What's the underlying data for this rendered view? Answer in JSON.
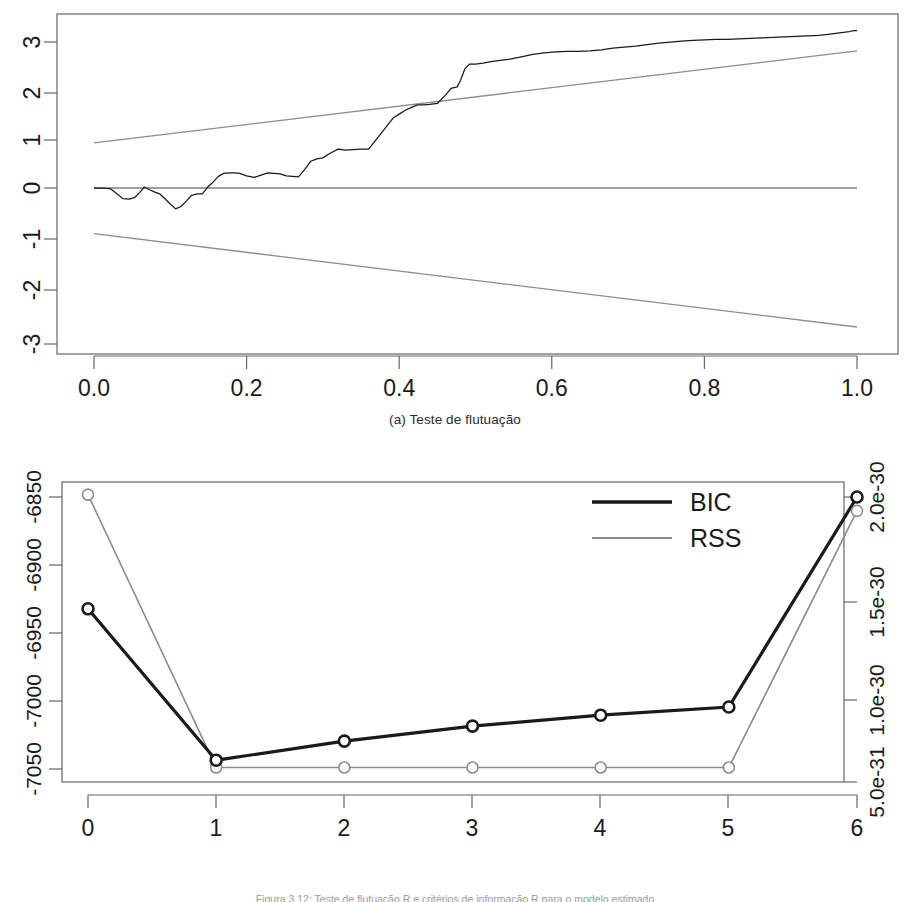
{
  "figure": {
    "caption_partial": "Figura 3.12: Teste de flutuação R e critérios de informação R para o modelo estimado"
  },
  "panels": [
    {
      "id": "a",
      "caption": "(a) Teste de flutuação"
    },
    {
      "id": "b",
      "caption": "(b) Critérios de informação"
    }
  ],
  "colors": {
    "series_black": "#1a1a1a",
    "series_gray": "#8c8c8c",
    "axis": "#555555",
    "frame": "#666666",
    "zero_line": "#808080"
  },
  "chart_data": [
    {
      "type": "line",
      "panel": "a",
      "title": "(a) Teste de flutuação",
      "xlabel": "",
      "ylabel": "",
      "xlim": [
        0.0,
        1.0
      ],
      "ylim": [
        -3.35,
        3.5
      ],
      "grid": false,
      "legend": "none",
      "xticks": [
        0.0,
        0.2,
        0.4,
        0.6,
        0.8,
        1.0
      ],
      "xticklabels": [
        "0.0",
        "0.2",
        "0.4",
        "0.6",
        "0.8",
        "1.0"
      ],
      "yticks": [
        -3,
        -2,
        -1,
        0,
        1,
        2,
        3
      ],
      "yticklabels": [
        "-3",
        "-2",
        "-1",
        "0",
        "1",
        "2",
        "3"
      ],
      "series": [
        {
          "name": "empirical-fluctuation-process",
          "color": "#1a1a1a",
          "x": [
            0.0,
            0.012,
            0.022,
            0.03,
            0.038,
            0.046,
            0.053,
            0.06,
            0.066,
            0.072,
            0.079,
            0.086,
            0.093,
            0.1,
            0.107,
            0.114,
            0.121,
            0.128,
            0.135,
            0.142,
            0.149,
            0.156,
            0.163,
            0.17,
            0.177,
            0.184,
            0.191,
            0.2,
            0.21,
            0.22,
            0.228,
            0.236,
            0.244,
            0.252,
            0.26,
            0.268,
            0.276,
            0.284,
            0.292,
            0.3,
            0.31,
            0.32,
            0.33,
            0.34,
            0.35,
            0.36,
            0.368,
            0.376,
            0.384,
            0.392,
            0.4,
            0.408,
            0.416,
            0.424,
            0.432,
            0.44,
            0.45,
            0.46,
            0.468,
            0.476,
            0.48,
            0.486,
            0.492,
            0.5,
            0.51,
            0.52,
            0.53,
            0.545,
            0.56,
            0.575,
            0.59,
            0.605,
            0.62,
            0.635,
            0.65,
            0.665,
            0.68,
            0.695,
            0.71,
            0.725,
            0.74,
            0.755,
            0.77,
            0.785,
            0.8,
            0.815,
            0.83,
            0.845,
            0.86,
            0.875,
            0.89,
            0.905,
            0.92,
            0.935,
            0.95,
            0.962,
            0.972,
            0.982,
            0.99,
            0.996,
            1.0
          ],
          "y": [
            0.0,
            0.0,
            -0.02,
            -0.12,
            -0.22,
            -0.23,
            -0.2,
            -0.09,
            0.02,
            -0.03,
            -0.08,
            -0.12,
            -0.22,
            -0.33,
            -0.43,
            -0.38,
            -0.27,
            -0.15,
            -0.12,
            -0.12,
            0.02,
            0.12,
            0.24,
            0.3,
            0.31,
            0.31,
            0.3,
            0.25,
            0.22,
            0.27,
            0.31,
            0.3,
            0.29,
            0.25,
            0.24,
            0.23,
            0.38,
            0.55,
            0.6,
            0.62,
            0.72,
            0.8,
            0.78,
            0.79,
            0.8,
            0.8,
            0.96,
            1.12,
            1.28,
            1.44,
            1.52,
            1.6,
            1.66,
            1.71,
            1.71,
            1.72,
            1.74,
            1.9,
            2.05,
            2.08,
            2.2,
            2.45,
            2.55,
            2.55,
            2.57,
            2.6,
            2.62,
            2.65,
            2.7,
            2.75,
            2.78,
            2.8,
            2.81,
            2.81,
            2.82,
            2.84,
            2.88,
            2.9,
            2.92,
            2.95,
            2.98,
            3.0,
            3.02,
            3.04,
            3.05,
            3.06,
            3.06,
            3.07,
            3.08,
            3.09,
            3.1,
            3.11,
            3.12,
            3.13,
            3.14,
            3.16,
            3.18,
            3.2,
            3.22,
            3.24,
            3.24
          ]
        },
        {
          "name": "upper-boundary",
          "color": "#8c8c8c",
          "x": [
            0.0,
            1.0
          ],
          "y": [
            0.93,
            2.82
          ]
        },
        {
          "name": "lower-boundary",
          "color": "#8c8c8c",
          "x": [
            0.0,
            1.0
          ],
          "y": [
            -0.94,
            -2.86
          ]
        },
        {
          "name": "zero-line",
          "color": "#808080",
          "x": [
            0.0,
            1.0
          ],
          "y": [
            0.0,
            0.0
          ]
        }
      ]
    },
    {
      "type": "line",
      "panel": "b",
      "title": "(b) Critérios de informação",
      "xlabel": "",
      "ylabel_left": "",
      "ylabel_right": "",
      "grid": false,
      "legend_position": "top-right",
      "xlim": [
        -0.25,
        6.25
      ],
      "xticks": [
        0,
        1,
        2,
        3,
        4,
        5,
        6
      ],
      "xticklabels": [
        "0",
        "1",
        "2",
        "3",
        "4",
        "5",
        "6"
      ],
      "left_axis": {
        "ticks": [
          -6850,
          -6900,
          -6950,
          -7000,
          -7050
        ],
        "ticklabels": [
          "-6850",
          "-6900",
          "-6950",
          "-7000",
          "-7050"
        ],
        "lim": [
          -7062,
          -6842
        ]
      },
      "right_axis": {
        "ticks": [
          2e-30,
          1.5e-30,
          1e-30,
          5e-31
        ],
        "ticklabels": [
          "2.0e-30",
          "1.5e-30",
          "1.0e-30",
          "5.0e-31"
        ],
        "lim": [
          4.2e-31,
          2.08e-30
        ]
      },
      "categories": [
        0,
        1,
        2,
        3,
        4,
        5,
        6
      ],
      "series": [
        {
          "name": "BIC",
          "color": "#1a1a1a",
          "axis": "left",
          "marker": "circle-open",
          "values": [
            -6935,
            -7046,
            -7032,
            -7021,
            -7013,
            -7007,
            -6853
          ]
        },
        {
          "name": "RSS",
          "color": "#8c8c8c",
          "axis": "right",
          "marker": "circle-open",
          "values": [
            2.01e-30,
            5e-31,
            5e-31,
            5e-31,
            5e-31,
            5e-31,
            1.92e-30
          ]
        }
      ],
      "legend_entries": [
        {
          "label": "BIC",
          "color": "#1a1a1a",
          "style": "solid"
        },
        {
          "label": "RSS",
          "color": "#8c8c8c",
          "style": "solid"
        }
      ]
    }
  ]
}
